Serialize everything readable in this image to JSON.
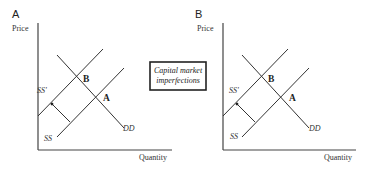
{
  "center_box": {
    "line1": "Capital market",
    "line2": "imperfections"
  },
  "panels": [
    {
      "id": "A",
      "letter": "A",
      "y_axis_label": "Price",
      "x_axis_label": "Quantity",
      "curves": {
        "supply": "SS",
        "shifted_supply": "SS'",
        "demand": "DD"
      },
      "points": {
        "original_equilibrium": "A",
        "new_equilibrium": "B"
      },
      "shift_direction": "SS to SS' (supply shifts left/up)"
    },
    {
      "id": "B",
      "letter": "B",
      "y_axis_label": "Price",
      "x_axis_label": "Quantity",
      "curves": {
        "supply": "SS",
        "shifted_supply": "SS'",
        "demand": "DD"
      },
      "points": {
        "original_equilibrium": "A",
        "new_equilibrium": "B"
      },
      "shift_direction": "SS to SS' (supply shifts left/up)"
    }
  ]
}
